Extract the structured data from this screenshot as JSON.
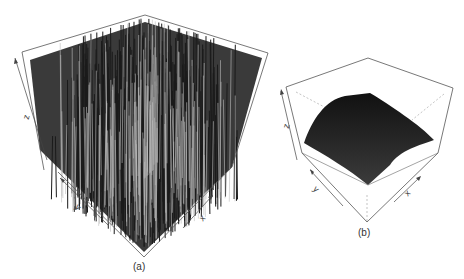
{
  "chart_data": [
    {
      "type": "surface3d",
      "panel_label": "(a)",
      "description": "Highly noisy / rugged 3D surface with dense sharp spikes across the whole grid",
      "axes": {
        "x": "x",
        "y": "y",
        "z": "z"
      },
      "grid": false,
      "box": true,
      "surface_color": "#2a2a2a"
    },
    {
      "type": "surface3d",
      "panel_label": "(b)",
      "description": "Smooth dome-shaped (concave) 3D surface peaking near the center",
      "axes": {
        "x": "x",
        "y": "y",
        "z": "z"
      },
      "grid": false,
      "box": true,
      "surface_color": "#1e1e1e"
    }
  ],
  "panels": {
    "a": {
      "label": "(a)",
      "x_axis": "x",
      "y_axis": "y",
      "z_axis": "z"
    },
    "b": {
      "label": "(b)",
      "x_axis": "x",
      "y_axis": "y",
      "z_axis": "z"
    }
  }
}
